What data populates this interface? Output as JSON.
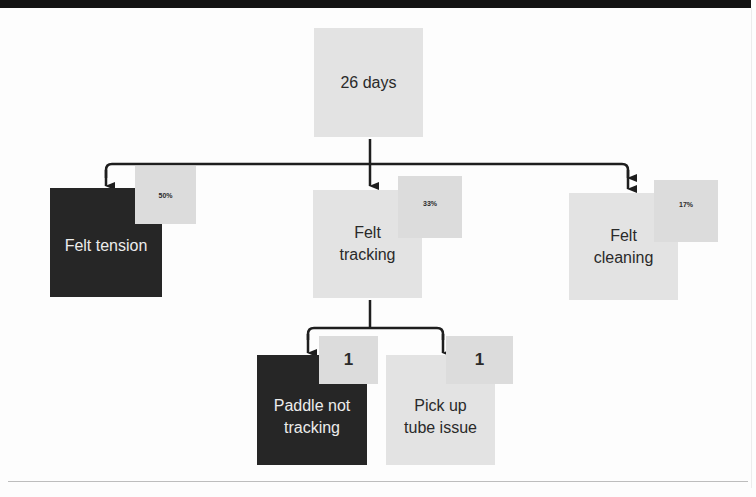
{
  "diagram": {
    "root": {
      "label": "26 days"
    },
    "level1": [
      {
        "label": "Felt tension",
        "badge": "50%",
        "style": "dark"
      },
      {
        "label": "Felt\ntracking",
        "badge": "33%",
        "style": "light"
      },
      {
        "label": "Felt\ncleaning",
        "badge": "17%",
        "style": "light"
      }
    ],
    "level2": [
      {
        "parent": "Felt tracking",
        "label": "Paddle not\ntracking",
        "badge": "1",
        "style": "dark"
      },
      {
        "parent": "Felt tracking",
        "label": "Pick up\ntube issue",
        "badge": "1",
        "style": "light"
      }
    ]
  },
  "colors": {
    "dark_box": "#262626",
    "light_box": "#e3e3e3",
    "badge": "#dcdcdc",
    "connector": "#1e1e1e",
    "top_bar": "#141414"
  }
}
